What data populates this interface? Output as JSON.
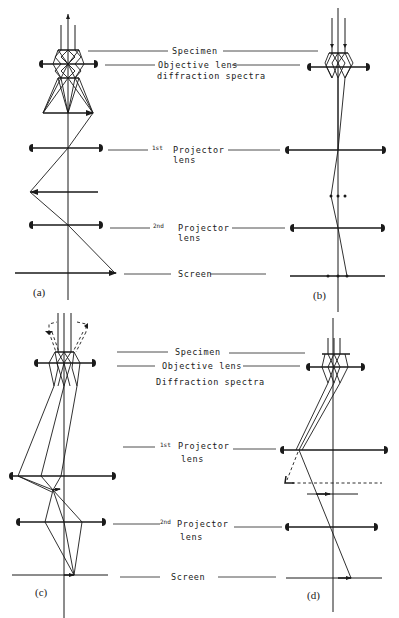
{
  "figure": {
    "panels": [
      {
        "id": "a",
        "label": "(a)",
        "mode": "image mode, three intermediate images"
      },
      {
        "id": "b",
        "label": "(b)",
        "mode": "diffraction mode"
      },
      {
        "id": "c",
        "label": "(c)",
        "mode": "image mode with tilted illumination"
      },
      {
        "id": "d",
        "label": "(d)",
        "mode": "low-magnification / tilted beam"
      }
    ]
  },
  "labels_top": {
    "specimen": "Specimen",
    "objective_line1": "Objective lens",
    "objective_line2": "diffraction spectra",
    "projector1_ord": "1st",
    "projector1": "Projector",
    "projector1_line2": "lens",
    "projector2_ord": "2nd",
    "projector2": "Projector",
    "projector2_line2": "lens",
    "screen": "Screen"
  },
  "labels_bottom": {
    "specimen": "Specimen",
    "objective": "Objective lens",
    "diffraction": "Diffraction spectra",
    "projector1_ord": "1st",
    "projector1": "Projector",
    "projector1_line2": "lens",
    "projector2_ord": "2nd",
    "projector2": "Projector",
    "projector2_line2": "lens",
    "screen": "Screen"
  },
  "panel_labels": {
    "a": "(a)",
    "b": "(b)",
    "c": "(c)",
    "d": "(d)"
  },
  "colors": {
    "ink": "#1a1a1a",
    "paper": "#ffffff"
  }
}
